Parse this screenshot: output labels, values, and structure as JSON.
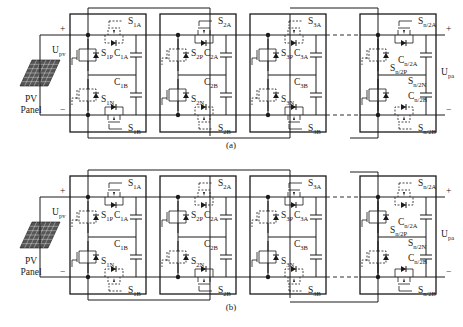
{
  "figure": {
    "panels": [
      {
        "id": "a",
        "caption": "(a)",
        "pv_label_line1": "PV",
        "pv_label_line2": "Panel",
        "input_voltage": {
          "main": "U",
          "sub": "pv"
        },
        "output_voltage": {
          "main": "U",
          "sub": "pa"
        },
        "plus": "+",
        "minus": "−",
        "modules": [
          {
            "sA": {
              "main": "S",
              "sub": "1A"
            },
            "sP": {
              "main": "S",
              "sub": "1P"
            },
            "cA": {
              "main": "C",
              "sub": "1A"
            },
            "sN": {
              "main": "S",
              "sub": "1N"
            },
            "cB": {
              "main": "C",
              "sub": "1B"
            },
            "sB": {
              "main": "S",
              "sub": "1B"
            },
            "pStyle": "solid",
            "nStyle": "dashed",
            "aStyle": "dashed",
            "bStyle": "solid"
          },
          {
            "sA": {
              "main": "S",
              "sub": "2A"
            },
            "sP": {
              "main": "S",
              "sub": "2P"
            },
            "cA": {
              "main": "C",
              "sub": "2A"
            },
            "sN": {
              "main": "S",
              "sub": "2N"
            },
            "cB": {
              "main": "C",
              "sub": "2B"
            },
            "sB": {
              "main": "S",
              "sub": "2B"
            },
            "pStyle": "dashed",
            "nStyle": "solid",
            "aStyle": "solid",
            "bStyle": "dashed"
          },
          {
            "sA": {
              "main": "S",
              "sub": "3A"
            },
            "sP": {
              "main": "S",
              "sub": "3P"
            },
            "cA": {
              "main": "C",
              "sub": "3A"
            },
            "sN": {
              "main": "S",
              "sub": "3N"
            },
            "cB": {
              "main": "C",
              "sub": "3B"
            },
            "sB": {
              "main": "S",
              "sub": "3B"
            },
            "pStyle": "solid",
            "nStyle": "dashed",
            "aStyle": "dashed",
            "bStyle": "solid"
          },
          {
            "sA": {
              "main": "S",
              "sub": "n/2A"
            },
            "sP": {
              "main": "S",
              "sub": "n/2P"
            },
            "cA": {
              "main": "C",
              "sub": "n/2A"
            },
            "sN": {
              "main": "S",
              "sub": "n/2N"
            },
            "cB": {
              "main": "C",
              "sub": "n/2B"
            },
            "sB": {
              "main": "S",
              "sub": "n/2B"
            },
            "pStyle": "dashed",
            "nStyle": "solid",
            "aStyle": "solid",
            "bStyle": "dashed"
          }
        ]
      },
      {
        "id": "b",
        "caption": "(b)",
        "pv_label_line1": "PV",
        "pv_label_line2": "Panel",
        "input_voltage": {
          "main": "U",
          "sub": "pv"
        },
        "output_voltage": {
          "main": "U",
          "sub": "pa"
        },
        "plus": "+",
        "minus": "−",
        "modules": [
          {
            "sA": {
              "main": "S",
              "sub": "1A"
            },
            "sP": {
              "main": "S",
              "sub": "1P"
            },
            "cA": {
              "main": "C",
              "sub": "1A"
            },
            "sN": {
              "main": "S",
              "sub": "1N"
            },
            "cB": {
              "main": "C",
              "sub": "1B"
            },
            "sB": {
              "main": "S",
              "sub": "1B"
            },
            "pStyle": "dashed",
            "nStyle": "solid",
            "aStyle": "solid",
            "bStyle": "dashed"
          },
          {
            "sA": {
              "main": "S",
              "sub": "2A"
            },
            "sP": {
              "main": "S",
              "sub": "2P"
            },
            "cA": {
              "main": "C",
              "sub": "2A"
            },
            "sN": {
              "main": "S",
              "sub": "2N"
            },
            "cB": {
              "main": "C",
              "sub": "2B"
            },
            "sB": {
              "main": "S",
              "sub": "2B"
            },
            "pStyle": "solid",
            "nStyle": "dashed",
            "aStyle": "dashed",
            "bStyle": "solid"
          },
          {
            "sA": {
              "main": "S",
              "sub": "3A"
            },
            "sP": {
              "main": "S",
              "sub": "3P"
            },
            "cA": {
              "main": "C",
              "sub": "3A"
            },
            "sN": {
              "main": "S",
              "sub": "3N"
            },
            "cB": {
              "main": "C",
              "sub": "3B"
            },
            "sB": {
              "main": "S",
              "sub": "3B"
            },
            "pStyle": "dashed",
            "nStyle": "solid",
            "aStyle": "solid",
            "bStyle": "dashed"
          },
          {
            "sA": {
              "main": "S",
              "sub": "n/2A"
            },
            "sP": {
              "main": "S",
              "sub": "n/2P"
            },
            "cA": {
              "main": "C",
              "sub": "n/2A"
            },
            "sN": {
              "main": "S",
              "sub": "n/2N"
            },
            "cB": {
              "main": "C",
              "sub": "n/2B"
            },
            "sB": {
              "main": "S",
              "sub": "n/2B"
            },
            "pStyle": "solid",
            "nStyle": "dashed",
            "aStyle": "dashed",
            "bStyle": "solid"
          }
        ]
      }
    ]
  }
}
